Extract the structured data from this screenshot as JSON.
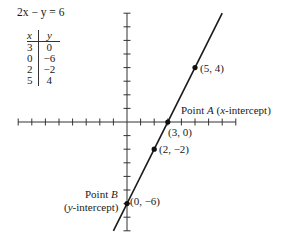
{
  "chart_data": {
    "type": "line",
    "title": "2x − y = 6",
    "equation": "2x − y = 6",
    "table": {
      "headers": [
        "x",
        "y"
      ],
      "rows": [
        [
          "3",
          "0"
        ],
        [
          "0",
          "−6"
        ],
        [
          "2",
          "−2"
        ],
        [
          "5",
          "4"
        ]
      ]
    },
    "points": [
      {
        "x": 3,
        "y": 0,
        "label": "(3, 0)"
      },
      {
        "x": 0,
        "y": -6,
        "label": "(0, −6)"
      },
      {
        "x": 2,
        "y": -2,
        "label": "(2, −2)"
      },
      {
        "x": 5,
        "y": 4,
        "label": "(5, 4)"
      }
    ],
    "annotations": [
      {
        "text": "Point A (x-intercept)",
        "point": [
          3,
          0
        ]
      },
      {
        "text": "Point B (y-intercept)",
        "point": [
          0,
          -6
        ]
      }
    ],
    "xlim": [
      -8,
      8
    ],
    "ylim": [
      -8,
      8
    ],
    "grid": false,
    "legend": "none",
    "xlabel": "",
    "ylabel": ""
  },
  "labels": {
    "equation": "2x − y = 6",
    "table_x": "x",
    "table_y": "y",
    "rows": [
      [
        "3",
        "0"
      ],
      [
        "0",
        "−6"
      ],
      [
        "2",
        "−2"
      ],
      [
        "5",
        "4"
      ]
    ],
    "p54": "(5, 4)",
    "p30": "(3, 0)",
    "p2m2": "(2, −2)",
    "p0m6": "(0, −6)",
    "pointA_word": "Point ",
    "pointA_letter": "A",
    "pointA_open": " (",
    "pointA_x": "x",
    "pointA_rest": "-intercept)",
    "pointB_word": "Point ",
    "pointB_letter": "B",
    "pointB_open": "(",
    "pointB_y": "y",
    "pointB_rest": "-intercept)"
  }
}
